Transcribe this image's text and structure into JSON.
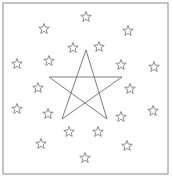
{
  "figure": {
    "frame": {
      "x": 3,
      "y": 3,
      "w": 165,
      "h": 171,
      "color": "#8a8a8a"
    },
    "central_star": {
      "points": [
        [
          86,
          50
        ],
        [
          62,
          119
        ],
        [
          122,
          77
        ],
        [
          49,
          77
        ],
        [
          107,
          119
        ]
      ],
      "color": "#6e6e6e"
    },
    "small_star": {
      "radius_outer": 5.5,
      "radius_inner": 2.3,
      "color": "#707070"
    },
    "outer_ring_stars": [
      [
        86,
        17
      ],
      [
        44,
        29
      ],
      [
        128,
        31
      ],
      [
        17,
        64
      ],
      [
        154,
        67
      ],
      [
        17,
        109
      ],
      [
        153,
        111
      ],
      [
        41,
        144
      ],
      [
        127,
        146
      ],
      [
        85,
        158
      ]
    ],
    "inner_ring_stars": [
      [
        73,
        48
      ],
      [
        99,
        47
      ],
      [
        49,
        61
      ],
      [
        121,
        65
      ],
      [
        38,
        88
      ],
      [
        130,
        89
      ],
      [
        48,
        114
      ],
      [
        121,
        117
      ],
      [
        69,
        132
      ],
      [
        98,
        132
      ]
    ],
    "caption": ""
  }
}
